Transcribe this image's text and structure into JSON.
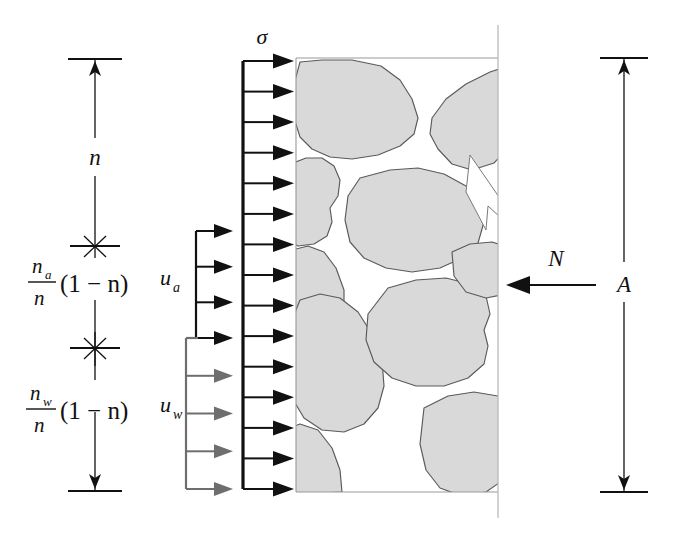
{
  "figure": {
    "background_color": "#ffffff",
    "grain_fill_color": "#d9d9d9",
    "grain_outline_color": "#5a5a5a",
    "ink_color": "#111111",
    "water_arrow_color": "#6e6e6e"
  },
  "labels": {
    "sigma": "σ",
    "n": "n",
    "u_a_base": "u",
    "u_a_sub": "a",
    "u_w_base": "u",
    "u_w_sub": "w",
    "N": "N",
    "A": "A"
  },
  "fractions": {
    "air": {
      "numerator_base": "n",
      "numerator_sub": "a",
      "denominator": "n",
      "factor": "(1 − n)"
    },
    "water": {
      "numerator_base": "n",
      "numerator_sub": "w",
      "denominator": "n",
      "factor": "(1 − n)"
    }
  },
  "dimension_left": {
    "segments": [
      {
        "name": "porosity-n",
        "label": "n"
      },
      {
        "name": "air-fraction",
        "label": "na/n (1-n)"
      },
      {
        "name": "water-fraction",
        "label": "nw/n (1-n)"
      }
    ],
    "tick_markers": "star-cross"
  },
  "dimension_right": {
    "label": "A",
    "arrow_top": "up",
    "arrow_bottom": "down"
  },
  "load_arrows": {
    "sigma": {
      "label": "σ",
      "count": 15,
      "color": "#111111",
      "direction": "right"
    },
    "u_a": {
      "label": "ua",
      "count": 4,
      "color": "#111111",
      "direction": "right"
    },
    "u_w": {
      "label": "uw",
      "count": 5,
      "color": "#6e6e6e",
      "direction": "right"
    },
    "N": {
      "label": "N",
      "count": 1,
      "color": "#111111",
      "direction": "left"
    }
  }
}
